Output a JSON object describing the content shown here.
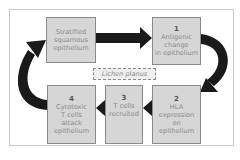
{
  "diagram": {
    "center_label": "Lichen planus",
    "nodes": [
      {
        "id": "start",
        "number": "",
        "lines": [
          "Stratified",
          "squamous",
          "epithelium"
        ]
      },
      {
        "id": "step1",
        "number": "1",
        "lines": [
          "Antigenic",
          "change",
          "in epithelium"
        ]
      },
      {
        "id": "step2",
        "number": "2",
        "lines": [
          "HLA",
          "expression",
          "on",
          "epithelium"
        ]
      },
      {
        "id": "step3",
        "number": "3",
        "lines": [
          "T cells",
          "recruited"
        ]
      },
      {
        "id": "step4",
        "number": "4",
        "lines": [
          "Cytotoxic",
          "T cells",
          "attack",
          "epithelium"
        ]
      }
    ],
    "edges": [
      {
        "from": "start",
        "to": "step1"
      },
      {
        "from": "step1",
        "to": "step2"
      },
      {
        "from": "step2",
        "to": "step3"
      },
      {
        "from": "step3",
        "to": "step4"
      },
      {
        "from": "step4",
        "to": "start"
      }
    ],
    "colors": {
      "box_fill": "#d6d6d6",
      "box_border": "#8a8a8a",
      "text": "#8a8a8a",
      "arrow": "#1a1a1a"
    }
  }
}
